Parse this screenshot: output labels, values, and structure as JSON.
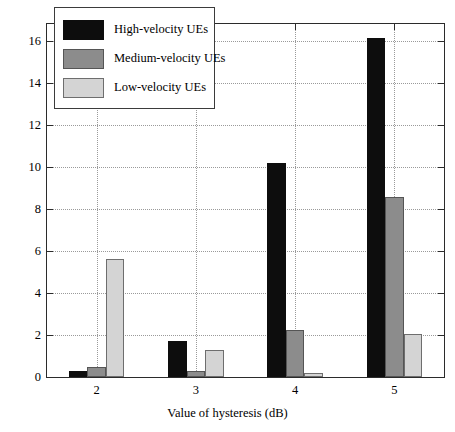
{
  "chart_data": {
    "type": "bar",
    "title": "",
    "xlabel": "Value of hysteresis (dB)",
    "ylabel": "The probability of RLF event to occur for 2000 users (%)",
    "categories": [
      "2",
      "3",
      "4",
      "5"
    ],
    "series": [
      {
        "name": "High-velocity UEs",
        "values": [
          0.3,
          1.7,
          10.2,
          16.15
        ]
      },
      {
        "name": "Medium-velocity UEs",
        "values": [
          0.5,
          0.3,
          2.25,
          8.55
        ]
      },
      {
        "name": "Low-velocity UEs",
        "values": [
          5.6,
          1.3,
          0.2,
          2.05
        ]
      }
    ],
    "ylim": [
      0,
      16.8
    ],
    "yticks": [
      0,
      2,
      4,
      6,
      8,
      10,
      12,
      14,
      16
    ],
    "ytick_labels": [
      "0",
      "2",
      "4",
      "6",
      "8",
      "10",
      "12",
      "14",
      "16"
    ],
    "xticks": [
      "2",
      "3",
      "4",
      "5"
    ],
    "grid": true,
    "grid_style": "dotted",
    "legend_position": "upper left",
    "colors": {
      "high": "#0d0d0d",
      "medium": "#8c8c8c",
      "low": "#d4d4d4",
      "axis": "#2b2b2b",
      "grid": "#9a9a9a",
      "background": "#ffffff"
    }
  },
  "legend": {
    "items": [
      {
        "label": "High-velocity UEs",
        "key": "high"
      },
      {
        "label": "Medium-velocity UEs",
        "key": "medium"
      },
      {
        "label": "Low-velocity UEs",
        "key": "low"
      }
    ]
  }
}
